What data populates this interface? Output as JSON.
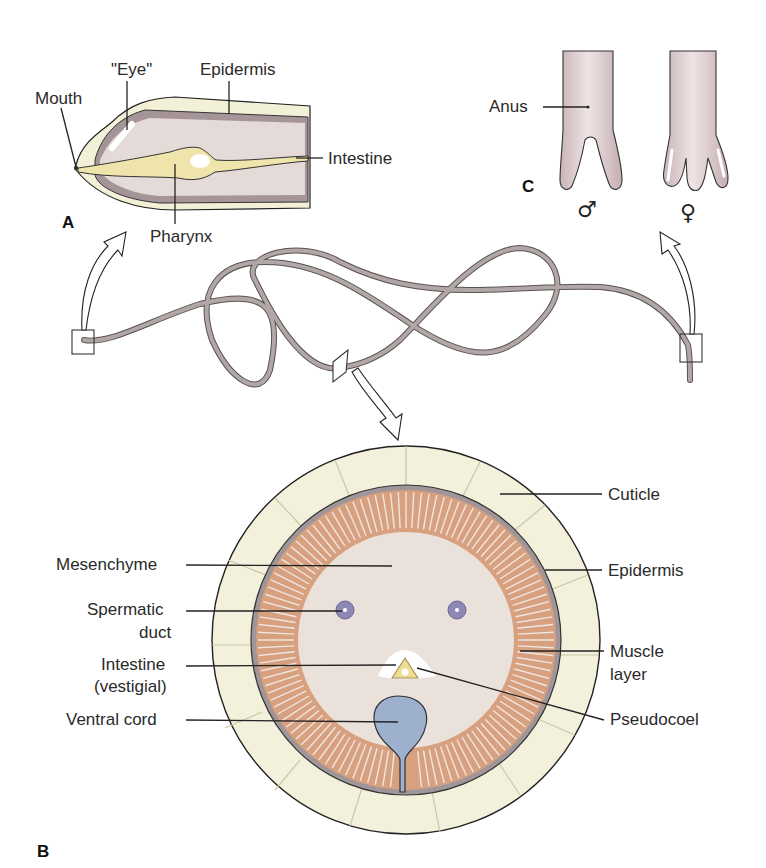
{
  "figure": {
    "panels": {
      "a": {
        "label": "A",
        "title": "Anterior end (longitudinal section)",
        "labels": {
          "mouth": "Mouth",
          "eye": "\"Eye\"",
          "epidermis": "Epidermis",
          "intestine": "Intestine",
          "pharynx": "Pharynx"
        }
      },
      "b": {
        "label": "B",
        "title": "Cross section",
        "labels": {
          "cuticle": "Cuticle",
          "mesenchyme": "Mesenchyme",
          "epidermis": "Epidermis",
          "spermatic_duct_1": "Spermatic",
          "spermatic_duct_2": "duct",
          "muscle_layer_1": "Muscle",
          "muscle_layer_2": "layer",
          "intestine_1": "Intestine",
          "intestine_2": "(vestigial)",
          "pseudocoel": "Pseudocoel",
          "ventral_cord": "Ventral cord"
        }
      },
      "c": {
        "label": "C",
        "title": "Posterior ends",
        "labels": {
          "anus": "Anus",
          "male_symbol": "♂",
          "female_symbol": "♀"
        }
      }
    },
    "colors": {
      "cuticle": "#f2f0dc",
      "epidermis_band": "#9c8e92",
      "body_fill": "#e8dcd8",
      "muscle": "#dca582",
      "mesenchyme": "#ece2dc",
      "spermatic_duct": "#8a86b0",
      "ventral_cord": "#9db0cc",
      "intestine": "#efe3a8",
      "worm": "#a49a98",
      "tail": "#d9c6c8"
    }
  }
}
